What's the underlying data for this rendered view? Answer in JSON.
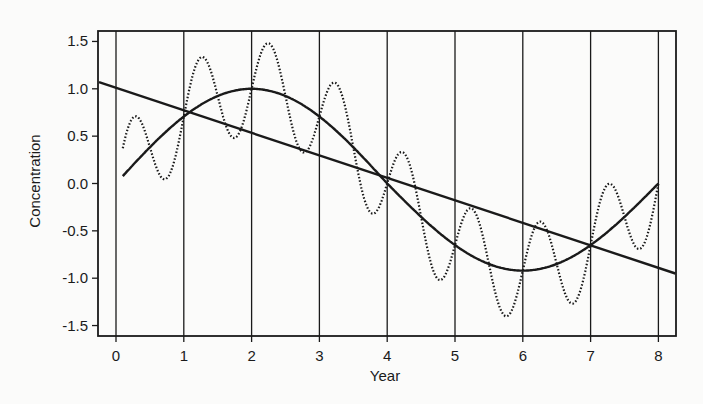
{
  "chart_data": {
    "type": "line",
    "title": "",
    "xlabel": "Year",
    "ylabel": "Concentration",
    "xlim": [
      -0.25,
      8.25
    ],
    "ylim": [
      -1.6,
      1.6
    ],
    "x_ticks": [
      0,
      1,
      2,
      3,
      4,
      5,
      6,
      7,
      8
    ],
    "x_tick_labels": [
      "0",
      "1",
      "2",
      "3",
      "4",
      "5",
      "6",
      "7",
      "8"
    ],
    "y_ticks": [
      1.5,
      1.0,
      0.5,
      0.0,
      -0.5,
      -1.0,
      -1.5
    ],
    "y_tick_labels": [
      "1.5",
      "1.0",
      "0.5",
      "0.0",
      "-0.5",
      "-1.0",
      "-1.5"
    ],
    "grid": {
      "vertical_lines_at_x_ticks": true,
      "horizontal": false
    },
    "legend": null,
    "series": [
      {
        "name": "Linear trend",
        "style": "solid",
        "x": [
          -0.25,
          8.25
        ],
        "y": [
          1.07,
          -0.95
        ]
      },
      {
        "name": "Seasonal (annual-period) cycle",
        "style": "solid",
        "x": [
          0.1,
          0.5,
          1,
          1.5,
          2,
          2.5,
          3,
          3.5,
          4,
          4.5,
          5,
          5.5,
          6,
          6.5,
          7,
          7.5,
          8
        ],
        "y": [
          0.08,
          0.38,
          0.71,
          0.92,
          1.0,
          0.92,
          0.71,
          0.38,
          0.0,
          -0.38,
          -0.68,
          -0.88,
          -0.92,
          -0.88,
          -0.7,
          -0.38,
          0.05
        ]
      },
      {
        "name": "Combined (cycle + sub-annual oscillation)",
        "style": "dotted",
        "x": [
          0.1,
          0.25,
          0.75,
          1,
          1.25,
          1.75,
          2,
          2.25,
          2.75,
          3,
          3.25,
          3.75,
          4,
          4.25,
          4.75,
          5,
          5.25,
          5.75,
          6,
          6.25,
          6.75,
          7,
          7.25,
          7.75,
          8
        ],
        "y": [
          0.3,
          0.7,
          0.07,
          0.71,
          1.33,
          0.5,
          1.0,
          1.5,
          0.5,
          0.71,
          1.15,
          -0.2,
          0.0,
          0.35,
          -0.85,
          -0.68,
          -0.25,
          -1.42,
          -0.92,
          -0.45,
          -1.25,
          -0.7,
          0.03,
          -0.62,
          0.05
        ]
      }
    ]
  },
  "plot": {
    "left": 98,
    "top": 31,
    "right": 676,
    "bottom": 336,
    "x0_px": 116,
    "x_px_per_unit": 67.8,
    "y0_px": 183.5,
    "y_px_per_unit": 94.7
  },
  "colors": {
    "ink": "#1a1a1a",
    "background": "#fbfbfa"
  }
}
